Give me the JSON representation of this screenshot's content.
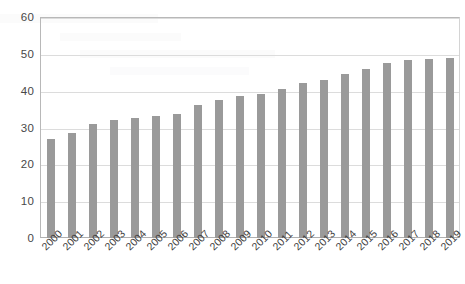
{
  "chart_data": {
    "type": "bar",
    "title": "",
    "subtitle": "",
    "xlabel": "",
    "ylabel": "",
    "ylim": [
      0,
      60
    ],
    "y_ticks": [
      0,
      10,
      20,
      30,
      40,
      50,
      60
    ],
    "grid": true,
    "legend": null,
    "bar_color": "#9a9a9a",
    "categories": [
      "2000",
      "2001",
      "2002",
      "2003",
      "2004",
      "2005",
      "2006",
      "2007",
      "2008",
      "2009",
      "2010",
      "2011",
      "2012",
      "2013",
      "2014",
      "2015",
      "2016",
      "2017",
      "2018",
      "2019"
    ],
    "values": [
      27,
      28.5,
      31,
      32,
      32.5,
      33,
      33.8,
      36,
      37.5,
      38.5,
      39,
      40.5,
      42,
      43,
      44.5,
      46,
      47.5,
      48.3,
      48.5,
      49
    ]
  },
  "axes": {
    "y_tick_labels": [
      "60",
      "50",
      "40",
      "30",
      "20",
      "10",
      "0"
    ],
    "x_tick_labels": [
      "2000",
      "2001",
      "2002",
      "2003",
      "2004",
      "2005",
      "2006",
      "2007",
      "2008",
      "2009",
      "2010",
      "2011",
      "2012",
      "2013",
      "2014",
      "2015",
      "2016",
      "2017",
      "2018",
      "2019"
    ]
  }
}
